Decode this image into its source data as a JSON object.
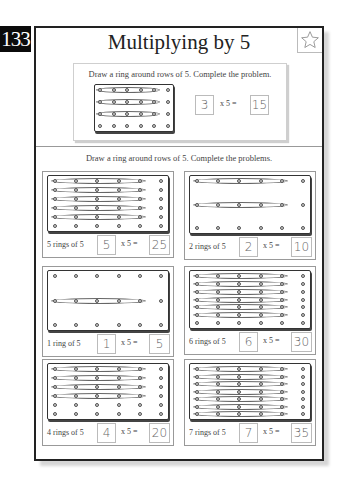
{
  "page": {
    "number": "133",
    "title": "Multiplying by 5",
    "star_icon": "star-outline"
  },
  "example": {
    "instruction": "Draw a ring around rows of 5. Complete the problem.",
    "rows": 4,
    "cols": 6,
    "rings": 3,
    "multiplicand": "3",
    "times": "x",
    "factor": "5",
    "equals": "=",
    "product": "15"
  },
  "section": {
    "instruction": "Draw a ring around rows of 5. Complete the problems."
  },
  "problems": [
    {
      "label": "5 rings of 5",
      "rows": 6,
      "cols": 6,
      "rings": 5,
      "multiplicand": "5",
      "times": "x",
      "factor": "5",
      "equals": "=",
      "product": "25"
    },
    {
      "label": "2 rings of 5",
      "rows": 3,
      "cols": 6,
      "rings": 2,
      "multiplicand": "2",
      "times": "x",
      "factor": "5",
      "equals": "=",
      "product": "10"
    },
    {
      "label": "1 ring of 5",
      "rows": 3,
      "cols": 6,
      "rings": 1,
      "ring_rows": [
        1
      ],
      "multiplicand": "1",
      "times": "x",
      "factor": "5",
      "equals": "=",
      "product": "5"
    },
    {
      "label": "6 rings of 5",
      "rows": 7,
      "cols": 6,
      "rings": 6,
      "multiplicand": "6",
      "times": "x",
      "factor": "5",
      "equals": "=",
      "product": "30"
    },
    {
      "label": "4 rings of 5",
      "rows": 6,
      "cols": 6,
      "rings": 4,
      "multiplicand": "4",
      "times": "x",
      "factor": "5",
      "equals": "=",
      "product": "20"
    },
    {
      "label": "7 rings of 5",
      "rows": 7,
      "cols": 6,
      "rings": 7,
      "multiplicand": "7",
      "times": "x",
      "factor": "5",
      "equals": "=",
      "product": "35"
    }
  ]
}
